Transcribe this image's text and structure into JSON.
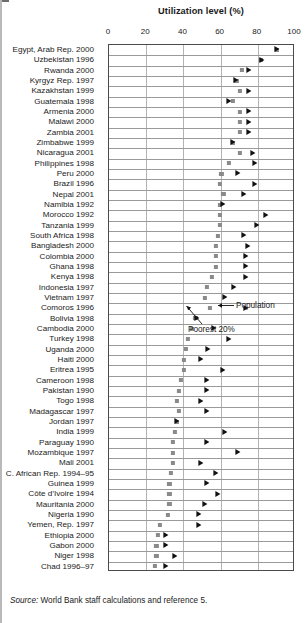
{
  "chart_data": {
    "type": "scatter",
    "title": "Utilization level (%)",
    "xlabel": "Utilization level (%)",
    "ylabel": "",
    "xlim": [
      0,
      100
    ],
    "xticks": [
      0,
      20,
      40,
      60,
      80,
      100
    ],
    "grid": true,
    "legend_position": "inline-annotation",
    "series": [
      {
        "name": "Poorest 20%",
        "marker": "square",
        "color": "#8a8a8a"
      },
      {
        "name": "Population",
        "marker": "triangle",
        "color": "#111111"
      }
    ],
    "categories": [
      "Egypt, Arab Rep. 2000",
      "Uzbekistan 1996",
      "Rwanda 2000",
      "Kyrgyz Rep. 1997",
      "Kazakhstan 1999",
      "Guatemala 1998",
      "Armenia 2000",
      "Malawi 2000",
      "Zambia 2001",
      "Zimbabwe 1999",
      "Nicaragua 2001",
      "Philippines 1998",
      "Peru 2000",
      "Brazil 1996",
      "Nepal 2001",
      "Namibia 1992",
      "Morocco 1992",
      "Tanzania 1999",
      "South Africa 1998",
      "Bangladesh 2000",
      "Colombia 2000",
      "Ghana 1998",
      "Kenya 1998",
      "Indonesia 1997",
      "Vietnam 1997",
      "Comoros 1996",
      "Bolivia 1998",
      "Cambodia 2000",
      "Turkey 1998",
      "Uganda 2000",
      "Haiti 2000",
      "Eritrea 1995",
      "Cameroon 1998",
      "Pakistan 1990",
      "Togo 1998",
      "Madagascar 1997",
      "Jordan 1997",
      "India 1999",
      "Paraguay 1990",
      "Mozambique 1997",
      "Mali 2001",
      "C. African Rep. 1994–95",
      "Guinea 1999",
      "Côte d’Ivoire 1994",
      "Mauritania 2000",
      "Nigeria 1990",
      "Yemen, Rep. 1997",
      "Ethiopia 2000",
      "Gabon 2000",
      "Niger 1998",
      "Chad 1996–97"
    ],
    "poorest20_values": [
      91,
      82,
      72,
      69,
      71,
      67,
      71,
      71,
      71,
      67,
      71,
      65,
      61,
      60,
      62,
      60,
      60,
      60,
      59,
      58,
      58,
      58,
      56,
      53,
      52,
      55,
      47,
      45,
      43,
      42,
      41,
      41,
      39,
      38,
      37,
      38,
      37,
      36,
      35,
      35,
      35,
      34,
      33,
      33,
      33,
      32,
      28,
      27,
      26,
      26,
      25
    ],
    "population_values": [
      91,
      83,
      76,
      69,
      76,
      65,
      76,
      76,
      76,
      67,
      78,
      79,
      70,
      79,
      73,
      62,
      85,
      80,
      73,
      75,
      74,
      74,
      74,
      68,
      63,
      74,
      48,
      57,
      65,
      54,
      50,
      62,
      53,
      53,
      50,
      53,
      37,
      63,
      53,
      70,
      50,
      58,
      53,
      59,
      52,
      49,
      49,
      31,
      31,
      36,
      31
    ]
  },
  "annotations": {
    "population": "Population",
    "poorest": "Poorest 20%"
  },
  "source": {
    "label": "Source:",
    "text": "World Bank staff calculations and reference 5."
  }
}
